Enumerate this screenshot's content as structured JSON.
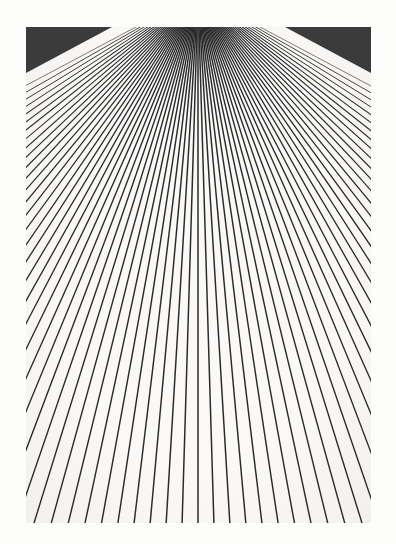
{
  "figure": {
    "medium": "scanned print",
    "background_color": "#fdfdfc",
    "plate_color": "#faf9f7",
    "line_color": "#2b2b2b",
    "canvas": {
      "width": 396,
      "height": 544
    },
    "plate": {
      "x": 26,
      "y": 27,
      "width": 345,
      "height": 496
    }
  },
  "chart_data": {
    "type": "line",
    "subtitle": "",
    "xlabel": "",
    "ylabel": "",
    "grid": false,
    "legend": null,
    "xlim": [
      26,
      371
    ],
    "ylim": [
      27,
      523
    ],
    "vanishing_point": {
      "x": 198,
      "y": -6
    },
    "ray_count": 73,
    "angle_start_deg": -62,
    "angle_end_deg": 62,
    "angle_step_deg": 1.722,
    "radius_center": 700,
    "radius_edge": 430,
    "line_width_near": 1.5,
    "line_width_far": 0.6,
    "symmetry": "bilateral about x = 198",
    "dark_corners": [
      "top-left",
      "top-right"
    ]
  },
  "annotations": {
    "top_left_mass": "dark converged triangle",
    "top_right_mass": "dark converged triangle",
    "bottom_visible_rays": 7
  }
}
